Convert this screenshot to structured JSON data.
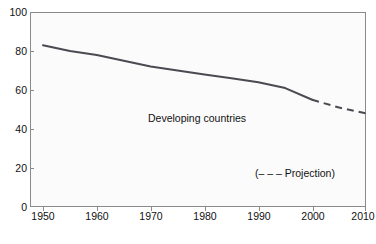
{
  "chart_data": {
    "type": "line",
    "title": "",
    "xlabel": "",
    "ylabel": "",
    "xlim": [
      1950,
      2010
    ],
    "ylim": [
      0,
      100
    ],
    "grid": false,
    "legend_position": "inline-annotation",
    "xticks": [
      1950,
      1960,
      1970,
      1980,
      1990,
      2000,
      2010
    ],
    "yticks": [
      0,
      20,
      40,
      60,
      80,
      100
    ],
    "xtick_labels": [
      "1950",
      "1960",
      "1970",
      "1980",
      "1990",
      "2000",
      "2010"
    ],
    "ytick_labels": [
      "0",
      "20",
      "40",
      "60",
      "80",
      "100"
    ],
    "series": [
      {
        "name": "Developing countries",
        "style": "solid",
        "color": "#4a4a52",
        "x": [
          1950,
          1955,
          1960,
          1965,
          1970,
          1975,
          1980,
          1985,
          1990,
          1995,
          2000
        ],
        "values": [
          83,
          80,
          78,
          75,
          72,
          70,
          68,
          66,
          64,
          61,
          55
        ]
      },
      {
        "name": "Projection",
        "style": "dashed",
        "color": "#4a4a52",
        "x": [
          2000,
          2005,
          2010
        ],
        "values": [
          55,
          51,
          48
        ]
      }
    ],
    "annotations": [
      {
        "text": "Developing countries",
        "x": 1976,
        "y": 44
      },
      {
        "text": "(– – –  Projection)",
        "x": 1994,
        "y": 16
      }
    ]
  },
  "axis": {
    "y_labels": [
      "100",
      "80",
      "60",
      "40",
      "20",
      "0"
    ],
    "x_labels": [
      "1950",
      "1960",
      "1970",
      "1980",
      "1990",
      "2000",
      "2010"
    ]
  },
  "annotations": {
    "series_label": "Developing countries",
    "projection_label": "(– – –  Projection)"
  },
  "colors": {
    "line": "#4a4a52",
    "axis": "#8a8a8a",
    "plot_background": "#fbfbfb",
    "page_background": "#ffffff",
    "text": "#111111"
  },
  "title": {
    "text": ""
  }
}
